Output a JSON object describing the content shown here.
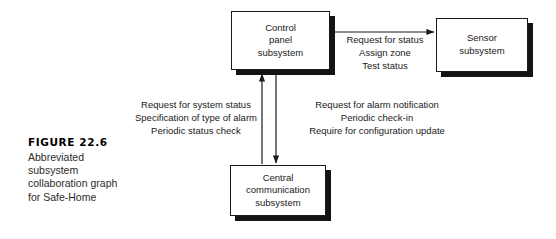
{
  "figure": {
    "number_label": "FIGURE 22.6",
    "caption": "Abbreviated subsystem collaboration graph for Safe-Home"
  },
  "nodes": [
    {
      "id": "control-panel",
      "label": "Control\npanel\nsubsystem"
    },
    {
      "id": "sensor",
      "label": "Sensor\nsubsystem"
    },
    {
      "id": "central-communication",
      "label": "Central\ncommunication\nsubsystem"
    }
  ],
  "edges": [
    {
      "id": "control-panel-to-sensor",
      "from": "control-panel",
      "to": "sensor",
      "direction": "right",
      "label": "Request for status\nAssign zone\nTest status"
    },
    {
      "id": "central-communication-to-control-panel",
      "from": "central-communication",
      "to": "control-panel",
      "direction": "up",
      "label": "Request for system status\nSpecification of type of alarm\nPeriodic status check"
    },
    {
      "id": "control-panel-to-central-communication",
      "from": "control-panel",
      "to": "central-communication",
      "direction": "down",
      "label": "Request for alarm notification\nPeriodic check-in\nRequire for configuration update"
    }
  ],
  "colors": {
    "background": "#ffffff",
    "stroke": "#1a1a1a",
    "shadow": "#141414",
    "text": "#1a1a1a"
  }
}
